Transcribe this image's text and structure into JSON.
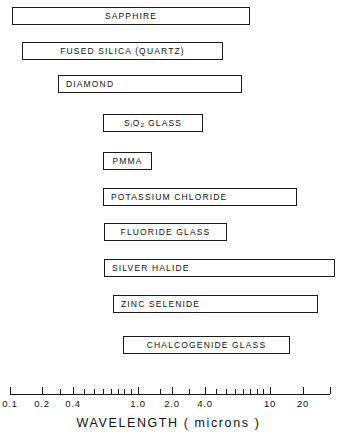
{
  "chart_data": {
    "type": "bar",
    "orientation": "horizontal",
    "title": "",
    "xlabel": "WAVELENGTH ( microns )",
    "ylabel": "",
    "xscale": "log",
    "xlim": [
      0.1,
      26
    ],
    "grid": false,
    "legend": null,
    "xtick_labels": [
      "0.1",
      "0.2",
      "0.4",
      "1.0",
      "2.0",
      "4.0",
      "10",
      "20"
    ],
    "xtick_values": [
      0.1,
      0.2,
      0.4,
      1.0,
      2.0,
      4.0,
      10,
      20
    ],
    "minor_ticks": [
      0.3,
      0.5,
      0.6,
      0.7,
      0.8,
      0.9,
      1.5,
      2.5,
      3.0,
      3.5,
      5,
      6,
      7,
      8,
      9,
      15,
      25
    ],
    "categories": [
      "SAPPHIRE",
      "FUSED SILICA (QUARTZ)",
      "DIAMOND",
      "SiO2 GLASS",
      "PMMA",
      "POTASSIUM CHLORIDE",
      "FLUORIDE GLASS",
      "SILVER HALIDE",
      "ZINC SELENIDE",
      "CHALCOGENIDE GLASS"
    ],
    "bars": [
      {
        "label": "SAPPHIRE",
        "label_html": "SAPPHIRE",
        "label_align": "center",
        "x_min": 0.15,
        "x_max": 5.5,
        "px_left": 12,
        "px_right": 250,
        "px_top": 7,
        "row": 0
      },
      {
        "label": "FUSED SILICA (QUARTZ)",
        "label_html": "FUSED SILICA (QUARTZ)",
        "label_align": "center",
        "x_min": 0.2,
        "x_max": 3.6,
        "px_left": 22,
        "px_right": 223,
        "px_top": 42,
        "row": 1
      },
      {
        "label": "DIAMOND",
        "label_html": "DIAMOND",
        "label_align": "left",
        "x_min": 0.45,
        "x_max": 4.5,
        "px_left": 58,
        "px_right": 242,
        "px_top": 75,
        "row": 2
      },
      {
        "label": "SiO2 GLASS",
        "label_html": "S<sub>i</sub>O<sub>2</sub> GLASS",
        "label_align": "center",
        "x_min": 0.75,
        "x_max": 2.6,
        "px_left": 103,
        "px_right": 203,
        "px_top": 114,
        "row": 3
      },
      {
        "label": "PMMA",
        "label_html": "PMMA",
        "label_align": "center",
        "x_min": 0.75,
        "x_max": 1.4,
        "px_left": 103,
        "px_right": 152,
        "px_top": 152,
        "row": 4
      },
      {
        "label": "POTASSIUM CHLORIDE",
        "label_html": "POTASSIUM CHLORIDE",
        "label_align": "left",
        "x_min": 0.75,
        "x_max": 18,
        "px_left": 103,
        "px_right": 297,
        "px_top": 188,
        "row": 5
      },
      {
        "label": "FLUORIDE GLASS",
        "label_html": "FLUORIDE GLASS",
        "label_align": "center",
        "x_min": 0.78,
        "x_max": 3.9,
        "px_left": 104,
        "px_right": 227,
        "px_top": 223,
        "row": 6
      },
      {
        "label": "SILVER HALIDE",
        "label_html": "SILVER HALIDE",
        "label_align": "left",
        "x_min": 0.78,
        "x_max": 26,
        "px_left": 104,
        "px_right": 335,
        "px_top": 259,
        "row": 7
      },
      {
        "label": "ZINC SELENIDE",
        "label_html": "ZINC SELENIDE",
        "label_align": "left",
        "x_min": 0.95,
        "x_max": 21,
        "px_left": 113,
        "px_right": 318,
        "px_top": 295,
        "row": 8
      },
      {
        "label": "CHALCOGENIDE GLASS",
        "label_html": "CHALCOGENIDE GLASS",
        "label_align": "center",
        "x_min": 1.3,
        "x_max": 15,
        "px_left": 123,
        "px_right": 290,
        "px_top": 336,
        "row": 9
      }
    ],
    "axis": {
      "px_left": 10,
      "px_right": 330,
      "px_y": 394,
      "title": "WAVELENGTH ( microns )",
      "ticks": [
        {
          "label": "0.1",
          "px": 10,
          "major": true
        },
        {
          "label": "0.2",
          "px": 42,
          "major": true
        },
        {
          "label": "",
          "px": 60,
          "major": false
        },
        {
          "label": "0.4",
          "px": 73,
          "major": true
        },
        {
          "label": "",
          "px": 84,
          "major": false
        },
        {
          "label": "",
          "px": 94,
          "major": false
        },
        {
          "label": "",
          "px": 103,
          "major": false
        },
        {
          "label": "",
          "px": 111,
          "major": false
        },
        {
          "label": "",
          "px": 118,
          "major": false
        },
        {
          "label": "",
          "px": 124,
          "major": false
        },
        {
          "label": "",
          "px": 131,
          "major": false
        },
        {
          "label": "1.0",
          "px": 138,
          "major": true
        },
        {
          "label": "",
          "px": 160,
          "major": false
        },
        {
          "label": "2.0",
          "px": 172,
          "major": true
        },
        {
          "label": "",
          "px": 189,
          "major": false
        },
        {
          "label": "4.0",
          "px": 205,
          "major": true
        },
        {
          "label": "",
          "px": 216,
          "major": false
        },
        {
          "label": "",
          "px": 226,
          "major": false
        },
        {
          "label": "",
          "px": 235,
          "major": false
        },
        {
          "label": "",
          "px": 243,
          "major": false
        },
        {
          "label": "",
          "px": 250,
          "major": false
        },
        {
          "label": "",
          "px": 257,
          "major": false
        },
        {
          "label": "",
          "px": 263,
          "major": false
        },
        {
          "label": "10",
          "px": 270,
          "major": true
        },
        {
          "label": "20",
          "px": 303,
          "major": true
        },
        {
          "label": "",
          "px": 330,
          "major": true
        }
      ]
    }
  }
}
